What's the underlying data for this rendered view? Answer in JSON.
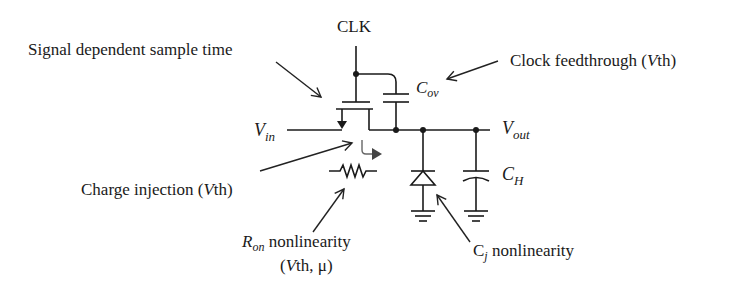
{
  "figure": {
    "nodes": {
      "clk": "CLK",
      "vin_main": "V",
      "vin_sub": "in",
      "vout_main": "V",
      "vout_sub": "out",
      "cov_main": "C",
      "cov_sub": "ov",
      "ch_main": "C",
      "ch_sub": "H"
    },
    "annotations": {
      "sample_time": "Signal dependent sample time",
      "clock_feedthrough_pre": "Clock feedthrough (",
      "clock_feedthrough_v": "V",
      "clock_feedthrough_post": "th)",
      "charge_injection_pre": "Charge injection (",
      "charge_injection_v": "V",
      "charge_injection_post": "th)",
      "ron_main": "R",
      "ron_sub": "on",
      "ron_text": " nonlinearity",
      "ron_line2_pre": "(",
      "ron_line2_v": "V",
      "ron_line2_post": "th, μ)",
      "cj_main": "C",
      "cj_sub": "j",
      "cj_text": " nonlinearity"
    },
    "components": [
      "NMOS switch",
      "C_ov overlap capacitor",
      "R_on resistor",
      "Junction diode C_j",
      "Hold capacitor C_H"
    ]
  }
}
